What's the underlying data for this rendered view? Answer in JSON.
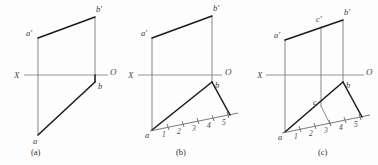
{
  "figure": {
    "background_color": "#fdfdfd",
    "heavy_line_color": "#1c1c1c",
    "thin_line_color": "#737373",
    "axis_line_color": "#828282"
  },
  "panels": [
    {
      "id": "a",
      "caption": "(a)",
      "axis": {
        "left_label": "X",
        "right_label": "O"
      },
      "points": [
        {
          "name": "a-prime",
          "label": "a'"
        },
        {
          "name": "b-prime",
          "label": "b'"
        },
        {
          "name": "b",
          "label": "b"
        },
        {
          "name": "a",
          "label": "a"
        }
      ],
      "scale_numbers": []
    },
    {
      "id": "b",
      "caption": "(b)",
      "axis": {
        "left_label": "X",
        "right_label": "O"
      },
      "points": [
        {
          "name": "a-prime",
          "label": "a'"
        },
        {
          "name": "b-prime",
          "label": "b'"
        },
        {
          "name": "b",
          "label": "b"
        },
        {
          "name": "a",
          "label": "a"
        }
      ],
      "scale_numbers": [
        "1",
        "2",
        "3",
        "4",
        "5"
      ]
    },
    {
      "id": "c",
      "caption": "(c)",
      "axis": {
        "left_label": "X",
        "right_label": "O"
      },
      "points": [
        {
          "name": "a-prime",
          "label": "a'"
        },
        {
          "name": "c-prime",
          "label": "c'"
        },
        {
          "name": "b-prime",
          "label": "b'"
        },
        {
          "name": "b",
          "label": "b"
        },
        {
          "name": "c",
          "label": "c"
        },
        {
          "name": "a",
          "label": "a"
        }
      ],
      "scale_numbers": [
        "1",
        "2",
        "3",
        "4",
        "5"
      ]
    }
  ]
}
